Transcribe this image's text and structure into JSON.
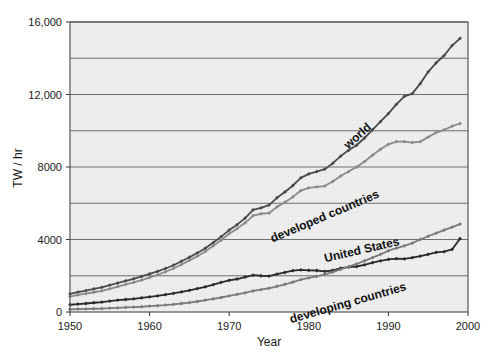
{
  "chart_data": {
    "type": "line",
    "title": "",
    "subtitle": "",
    "xlabel": "Year",
    "ylabel": "TW / hr",
    "xlim": [
      1950,
      2000
    ],
    "ylim": [
      0,
      16000
    ],
    "xticks": [
      1950,
      1960,
      1970,
      1980,
      1990,
      2000
    ],
    "xtick_labels": [
      "1950",
      "1960",
      "1970",
      "1980",
      "1990",
      "2000"
    ],
    "yticks": [
      0,
      4000,
      8000,
      12000,
      16000
    ],
    "ytick_labels": [
      "0",
      "4000",
      "8000",
      "12,000",
      "16,000"
    ],
    "gridlines_y": [
      2000,
      4000,
      6000,
      8000,
      10000,
      12000,
      14000,
      16000
    ],
    "grid": "horizontal",
    "legend_position": "inline-annotations",
    "markers": "small-diamond",
    "plot_background": "#ececec",
    "x": [
      1950,
      1951,
      1952,
      1953,
      1954,
      1955,
      1956,
      1957,
      1958,
      1959,
      1960,
      1961,
      1962,
      1963,
      1964,
      1965,
      1966,
      1967,
      1968,
      1969,
      1970,
      1971,
      1972,
      1973,
      1974,
      1975,
      1976,
      1977,
      1978,
      1979,
      1980,
      1981,
      1982,
      1983,
      1984,
      1985,
      1986,
      1987,
      1988,
      1989,
      1990,
      1991,
      1992,
      1993,
      1994,
      1995,
      1996,
      1997,
      1998,
      1999
    ],
    "series": [
      {
        "name": "world",
        "color": "#4a4a4a",
        "label": "world",
        "label_angle": -42,
        "values": [
          1000,
          1100,
          1180,
          1270,
          1360,
          1480,
          1600,
          1720,
          1830,
          1960,
          2100,
          2240,
          2400,
          2580,
          2800,
          3020,
          3260,
          3520,
          3830,
          4160,
          4520,
          4820,
          5180,
          5640,
          5750,
          5900,
          6300,
          6620,
          6980,
          7400,
          7620,
          7750,
          7880,
          8200,
          8600,
          8920,
          9200,
          9600,
          10050,
          10500,
          10950,
          11450,
          11900,
          12050,
          12600,
          13250,
          13750,
          14150,
          14700,
          15100
        ]
      },
      {
        "name": "developed countries",
        "color": "#8a8a8a",
        "label": "developed countries",
        "label_angle": -23,
        "values": [
          850,
          940,
          1010,
          1090,
          1170,
          1280,
          1400,
          1520,
          1630,
          1760,
          1900,
          2050,
          2220,
          2400,
          2620,
          2850,
          3080,
          3340,
          3650,
          3970,
          4320,
          4600,
          4920,
          5320,
          5420,
          5450,
          5800,
          6060,
          6350,
          6700,
          6850,
          6900,
          6950,
          7200,
          7500,
          7750,
          8000,
          8300,
          8650,
          8980,
          9250,
          9400,
          9400,
          9350,
          9400,
          9650,
          9900,
          10050,
          10250,
          10400
        ]
      },
      {
        "name": "United States",
        "color": "#2a2a2a",
        "label": "United States",
        "label_angle": -13,
        "values": [
          400,
          440,
          470,
          510,
          540,
          600,
          650,
          690,
          720,
          780,
          840,
          890,
          960,
          1030,
          1110,
          1190,
          1290,
          1390,
          1510,
          1640,
          1750,
          1820,
          1930,
          2030,
          2000,
          1980,
          2090,
          2180,
          2280,
          2320,
          2300,
          2290,
          2240,
          2290,
          2420,
          2480,
          2510,
          2600,
          2720,
          2820,
          2900,
          2940,
          2930,
          3000,
          3080,
          3180,
          3290,
          3330,
          3450,
          4050
        ]
      },
      {
        "name": "developing countries",
        "color": "#7a7a7a",
        "label": "developing countries",
        "label_angle": -16,
        "values": [
          150,
          160,
          170,
          180,
          190,
          210,
          230,
          250,
          270,
          290,
          320,
          350,
          380,
          420,
          470,
          520,
          580,
          650,
          720,
          800,
          890,
          970,
          1060,
          1160,
          1230,
          1310,
          1420,
          1530,
          1650,
          1790,
          1880,
          1970,
          2070,
          2200,
          2350,
          2500,
          2650,
          2820,
          3000,
          3180,
          3380,
          3520,
          3650,
          3800,
          4000,
          4180,
          4350,
          4520,
          4680,
          4850
        ]
      }
    ]
  },
  "axes": {
    "x_title": "Year",
    "y_title": "TW / hr"
  }
}
